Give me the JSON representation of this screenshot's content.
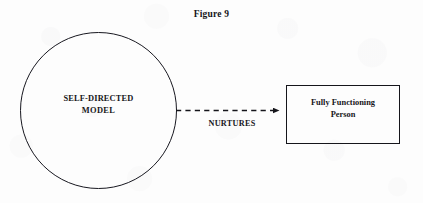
{
  "figure": {
    "caption": "Figure 9",
    "background_color": "#fdfdfd",
    "ink_color": "#16161a"
  },
  "nodes": {
    "source": {
      "shape": "circle",
      "label_line1": "SELF-DIRECTED",
      "label_line2": "MODEL"
    },
    "target": {
      "shape": "rectangle",
      "label_line1": "Fully Functioning",
      "label_line2": "Person"
    }
  },
  "edge": {
    "label": "NURTURES",
    "style": "dashed",
    "arrowhead": "filled-triangle",
    "direction": "source-to-target"
  }
}
